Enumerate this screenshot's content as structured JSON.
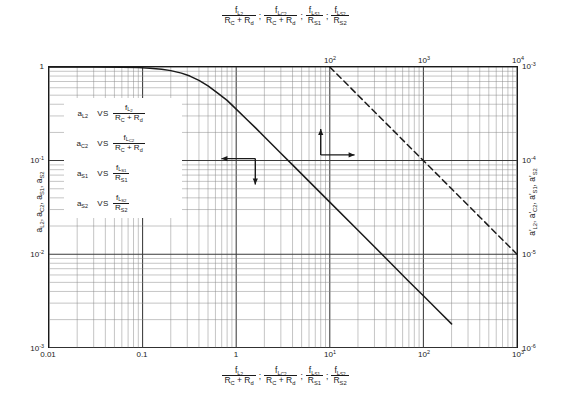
{
  "chart_data": {
    "type": "line",
    "title": "",
    "xlabel": "fL2/(RC+Rd) ; fLC2/(RC+Rd) ; fLS1/RS1 ; fLS2/RS2",
    "ylabel": "aL2, aC2, aS1, aS2",
    "xscale": "log",
    "yscale": "log",
    "grid": true,
    "legend_position": "inside-left",
    "xlim": [
      0.01,
      1000
    ],
    "ylim": [
      0.001,
      1
    ],
    "x2lim": [
      10,
      100000
    ],
    "y2lim": [
      1e-06,
      0.001
    ],
    "xticks": [
      "0.01",
      "0.1",
      "1",
      "10",
      "100",
      "1000"
    ],
    "xticklabels": [
      "0.01",
      "0.1",
      "1",
      "10¹",
      "10²",
      "10³"
    ],
    "yticklabels": [
      "1",
      "10⁻¹",
      "10⁻²",
      "10⁻³"
    ],
    "x2ticklabels": [
      "10²",
      "10³",
      "10⁴",
      "10⁵"
    ],
    "y2ticklabels": [
      "10⁻³",
      "10⁻⁴",
      "10⁻⁵",
      "10⁻⁶"
    ],
    "series": [
      {
        "name": "solid-curve",
        "style": "solid",
        "axis": "bottom-left",
        "points": [
          [
            0.01,
            1.0
          ],
          [
            0.03,
            1.0
          ],
          [
            0.06,
            0.995
          ],
          [
            0.09,
            0.985
          ],
          [
            0.12,
            0.97
          ],
          [
            0.16,
            0.945
          ],
          [
            0.2,
            0.915
          ],
          [
            0.26,
            0.86
          ],
          [
            0.32,
            0.8
          ],
          [
            0.4,
            0.72
          ],
          [
            0.5,
            0.63
          ],
          [
            0.63,
            0.53
          ],
          [
            0.8,
            0.44
          ],
          [
            1.0,
            0.355
          ],
          [
            1.3,
            0.275
          ],
          [
            1.6,
            0.225
          ],
          [
            2.0,
            0.18
          ],
          [
            3.0,
            0.12
          ],
          [
            4.0,
            0.09
          ],
          [
            6.0,
            0.06
          ],
          [
            10.0,
            0.036
          ],
          [
            20.0,
            0.018
          ],
          [
            40.0,
            0.009
          ],
          [
            70.0,
            0.0051
          ],
          [
            100.0,
            0.0036
          ],
          [
            150.0,
            0.0024
          ],
          [
            200.0,
            0.0018
          ]
        ]
      },
      {
        "name": "dashed-curve",
        "style": "dashed",
        "axis": "top-right",
        "points": [
          [
            100.0,
            0.001
          ],
          [
            200.0,
            0.0005
          ],
          [
            400.0,
            0.00025
          ],
          [
            1000.0,
            0.0001
          ],
          [
            2000.0,
            5e-05
          ],
          [
            4000.0,
            2.5e-05
          ],
          [
            10000.0,
            1e-05
          ],
          [
            40000.0,
            2.5e-06
          ],
          [
            100000.0,
            1e-06
          ]
        ]
      }
    ],
    "annotations": [
      {
        "name": "left-arrow-annotation",
        "desc": "arrow pointing left and down toward solid curve / left+bottom axes",
        "x": 1.0,
        "y": 0.1
      },
      {
        "name": "right-arrow-annotation",
        "desc": "arrow pointing right and up toward dashed curve / right+top axes",
        "x": 8.0,
        "y": 0.115
      }
    ]
  },
  "top_axis": {
    "name": "top-axis",
    "ticks": [
      {
        "label_base": "10",
        "label_exp": "2",
        "value": 100
      },
      {
        "label_base": "10",
        "label_exp": "3",
        "value": 1000
      },
      {
        "label_base": "10",
        "label_exp": "4",
        "value": 10000
      },
      {
        "label_base": "10",
        "label_exp": "5",
        "value": 100000
      }
    ],
    "caption": {
      "terms": [
        {
          "num_f": "f",
          "num_sub": "L",
          "num_sub2": "2",
          "den": "R",
          "den_sub": "C",
          "den_plus": "+ R",
          "den_sub2": "d"
        },
        {
          "num_f": "f",
          "num_sub": "L",
          "num_sub2": "C2",
          "den": "R",
          "den_sub": "C",
          "den_plus": "+ R",
          "den_sub2": "d"
        },
        {
          "num_f": "f",
          "num_sub": "L",
          "num_sub2": "S1",
          "den": "R",
          "den_sub": "S1",
          "den_plus": "",
          "den_sub2": ""
        },
        {
          "num_f": "f",
          "num_sub": "L",
          "num_sub2": "S2",
          "den": "R",
          "den_sub": "S2",
          "den_plus": "",
          "den_sub2": ""
        }
      ],
      "separator": ";"
    }
  },
  "bottom_axis": {
    "name": "bottom-axis",
    "ticks": [
      {
        "text": "0.01",
        "value": 0.01
      },
      {
        "text": "0.1",
        "value": 0.1
      },
      {
        "text": "1",
        "value": 1
      },
      {
        "label_base": "10",
        "label_exp": "1",
        "value": 10
      },
      {
        "label_base": "10",
        "label_exp": "2",
        "value": 100
      },
      {
        "label_base": "10",
        "label_exp": "3",
        "value": 1000
      }
    ]
  },
  "left_axis": {
    "name": "left-axis",
    "ticks": [
      {
        "base": "1",
        "exp": "",
        "value": 1
      },
      {
        "base": "10",
        "exp": "-1",
        "value": 0.1
      },
      {
        "base": "10",
        "exp": "-2",
        "value": 0.01
      },
      {
        "base": "10",
        "exp": "-3",
        "value": 0.001
      }
    ],
    "caption_parts": [
      "a",
      "L2",
      "a",
      "C2",
      "a",
      "S1",
      "a",
      "S2"
    ]
  },
  "right_axis": {
    "name": "right-axis",
    "ticks": [
      {
        "base": "10",
        "exp": "-3",
        "value": 0.001
      },
      {
        "base": "10",
        "exp": "-4",
        "value": 0.0001
      },
      {
        "base": "10",
        "exp": "-5",
        "value": 1e-05
      },
      {
        "base": "10",
        "exp": "-6",
        "value": 1e-06
      }
    ]
  },
  "legend": {
    "name": "curve-legend",
    "vs_label": "VS",
    "rows": [
      {
        "sym_base": "a",
        "sym_sub": "L2",
        "num_sub": "L",
        "num_sub2": "2",
        "den": "R",
        "den_sub": "C",
        "den_tail": "+ R",
        "den_sub2": "d"
      },
      {
        "sym_base": "a",
        "sym_sub": "C2",
        "num_sub": "L",
        "num_sub2": "C2",
        "den": "R",
        "den_sub": "C",
        "den_tail": "+ R",
        "den_sub2": "d"
      },
      {
        "sym_base": "a",
        "sym_sub": "S1",
        "num_sub": "L",
        "num_sub2": "S1",
        "den": "R",
        "den_sub": "S1",
        "den_tail": "",
        "den_sub2": ""
      },
      {
        "sym_base": "a",
        "sym_sub": "S2",
        "num_sub": "L",
        "num_sub2": "S2",
        "den": "R",
        "den_sub": "S2",
        "den_tail": "",
        "den_sub2": ""
      }
    ]
  },
  "colors": {
    "ink": "#1a1a1a",
    "grid_major": "#3a3a3a",
    "grid_minor": "#8a8a8a",
    "background": "#ffffff"
  }
}
